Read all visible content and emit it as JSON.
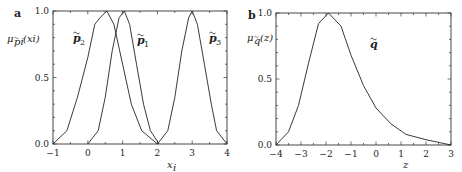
{
  "panels": {
    "a": {
      "letter": "a",
      "ylabel": "μp̃i(xi)",
      "ylabel_main": "μ",
      "ylabel_sub": "p̃i",
      "ylabel_arg": "(xi)",
      "xlabel": "xi",
      "xlabel_main": "x",
      "xlabel_sub": "i",
      "xticks": [
        "−1",
        "0",
        "1",
        "2",
        "3",
        "4"
      ],
      "yticks": [
        "0.0",
        "0.5",
        "1.0"
      ],
      "curve_labels": [
        {
          "name": "p̃2",
          "base": "p",
          "sub": "2"
        },
        {
          "name": "p̃1",
          "base": "p",
          "sub": "1"
        },
        {
          "name": "p̃3",
          "base": "p",
          "sub": "3"
        }
      ]
    },
    "b": {
      "letter": "b",
      "ylabel": "μq̃(z)",
      "ylabel_main": "μ",
      "ylabel_sub": "q̃",
      "ylabel_arg": "(z)",
      "xlabel": "z",
      "xticks": [
        "−4",
        "−3",
        "−2",
        "−1",
        "0",
        "1",
        "2",
        "3"
      ],
      "yticks": [
        "0.0",
        "0.5",
        "1.0"
      ],
      "curve_labels": [
        {
          "name": "q̃",
          "base": "q",
          "sub": ""
        }
      ]
    }
  },
  "chart_data": [
    {
      "type": "line",
      "title": "a",
      "xlabel": "x_i",
      "ylabel": "μ_{p̃_i}(x_i)",
      "xlim": [
        -1,
        4
      ],
      "ylim": [
        0,
        1
      ],
      "xticks": [
        -1,
        0,
        1,
        2,
        3,
        4
      ],
      "yticks": [
        0.0,
        0.5,
        1.0
      ],
      "grid": false,
      "legend": "inline labels",
      "series": [
        {
          "name": "p̃2",
          "x": [
            -1,
            -0.6,
            -0.3,
            0.0,
            0.2,
            0.35,
            0.55,
            0.75,
            1.0,
            1.25,
            1.55,
            2.0
          ],
          "y": [
            0.0,
            0.1,
            0.35,
            0.65,
            0.9,
            0.95,
            1.0,
            0.9,
            0.6,
            0.3,
            0.1,
            0.0
          ]
        },
        {
          "name": "p̃1",
          "x": [
            0.0,
            0.3,
            0.5,
            0.7,
            0.9,
            1.05,
            1.2,
            1.4,
            1.6,
            1.8,
            2.05
          ],
          "y": [
            0.0,
            0.1,
            0.35,
            0.7,
            0.95,
            1.0,
            0.9,
            0.6,
            0.3,
            0.1,
            0.0
          ]
        },
        {
          "name": "p̃3",
          "x": [
            2.0,
            2.3,
            2.5,
            2.7,
            2.9,
            3.0,
            3.15,
            3.35,
            3.55,
            3.7,
            4.0
          ],
          "y": [
            0.0,
            0.1,
            0.35,
            0.7,
            0.95,
            1.0,
            0.9,
            0.6,
            0.3,
            0.1,
            0.0
          ]
        }
      ]
    },
    {
      "type": "line",
      "title": "b",
      "xlabel": "z",
      "ylabel": "μ_{q̃}(z)",
      "xlim": [
        -4,
        3
      ],
      "ylim": [
        0,
        1
      ],
      "xticks": [
        -4,
        -3,
        -2,
        -1,
        0,
        1,
        2,
        3
      ],
      "yticks": [
        0.0,
        0.5,
        1.0
      ],
      "grid": false,
      "legend": "inline labels",
      "series": [
        {
          "name": "q̃",
          "x": [
            -4.0,
            -3.5,
            -3.1,
            -2.7,
            -2.3,
            -1.9,
            -1.4,
            -1.0,
            -0.5,
            0.0,
            0.6,
            1.2,
            2.0,
            3.0
          ],
          "y": [
            0.0,
            0.1,
            0.3,
            0.62,
            0.92,
            1.0,
            0.9,
            0.68,
            0.45,
            0.28,
            0.16,
            0.08,
            0.04,
            0.0
          ]
        }
      ]
    }
  ]
}
